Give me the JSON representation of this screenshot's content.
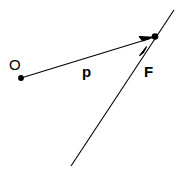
{
  "figure": {
    "width": 179,
    "height": 169,
    "background_color": "#ffffff",
    "stroke_color": "#000000"
  },
  "labels": {
    "origin": "O",
    "vector": "p",
    "line": "F"
  },
  "geometry": {
    "origin_point": {
      "name": "O",
      "x": 21,
      "y": 78,
      "radius": 3
    },
    "intersection_point": {
      "name": "F-point",
      "x": 155,
      "y": 37,
      "radius": 3.5
    },
    "vector_p": {
      "name": "p",
      "from_x": 21,
      "from_y": 78,
      "to_x": 152,
      "to_y": 38,
      "arrowhead": true
    },
    "line_f": {
      "name": "F",
      "from_x": 71,
      "from_y": 166,
      "to_x": 174,
      "to_y": 10,
      "arrowhead_x": 145,
      "arrowhead_y": 49,
      "arrowhead": true
    }
  }
}
